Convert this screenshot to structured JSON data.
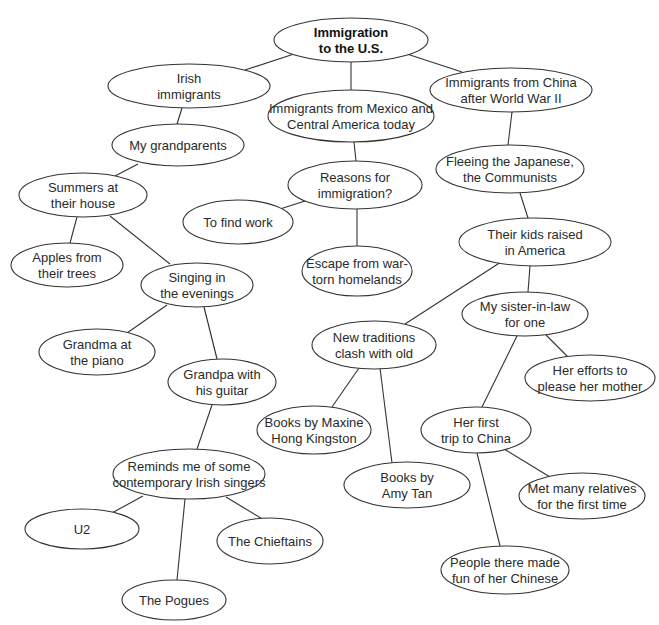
{
  "diagram": {
    "type": "cluster-map",
    "root": "n0",
    "nodes": [
      {
        "id": "n0",
        "lines": [
          "Immigration",
          "to the U.S."
        ],
        "cx": 351,
        "cy": 40,
        "rx": 77,
        "ry": 22,
        "bold": true
      },
      {
        "id": "n1",
        "lines": [
          "Irish",
          "immigrants"
        ],
        "cx": 189,
        "cy": 86,
        "rx": 81,
        "ry": 22
      },
      {
        "id": "n2",
        "lines": [
          "Immigrants from Mexico and",
          "Central America today"
        ],
        "cx": 351,
        "cy": 116,
        "rx": 83,
        "ry": 26
      },
      {
        "id": "n3",
        "lines": [
          "Immigrants from China",
          "after World War II"
        ],
        "cx": 511,
        "cy": 90,
        "rx": 81,
        "ry": 22
      },
      {
        "id": "n4",
        "lines": [
          "My grandparents"
        ],
        "cx": 178,
        "cy": 145,
        "rx": 66,
        "ry": 21
      },
      {
        "id": "n5",
        "lines": [
          "Reasons for",
          "immigration?"
        ],
        "cx": 355,
        "cy": 185,
        "rx": 67,
        "ry": 24
      },
      {
        "id": "n6",
        "lines": [
          "Fleeing the Japanese,",
          "the Communists"
        ],
        "cx": 510,
        "cy": 169,
        "rx": 74,
        "ry": 24
      },
      {
        "id": "n7",
        "lines": [
          "Summers at",
          "their house"
        ],
        "cx": 83,
        "cy": 195,
        "rx": 64,
        "ry": 22
      },
      {
        "id": "n8",
        "lines": [
          "To find work"
        ],
        "cx": 238,
        "cy": 222,
        "rx": 55,
        "ry": 22
      },
      {
        "id": "n9",
        "lines": [
          "Escape from war-",
          "torn homelands"
        ],
        "cx": 357,
        "cy": 271,
        "rx": 55,
        "ry": 25
      },
      {
        "id": "n10",
        "lines": [
          "Their kids raised",
          "in America"
        ],
        "cx": 535,
        "cy": 242,
        "rx": 76,
        "ry": 24
      },
      {
        "id": "n11",
        "lines": [
          "Apples from",
          "their trees"
        ],
        "cx": 67,
        "cy": 265,
        "rx": 56,
        "ry": 22
      },
      {
        "id": "n12",
        "lines": [
          "Singing in",
          "the evenings"
        ],
        "cx": 197,
        "cy": 285,
        "rx": 56,
        "ry": 22
      },
      {
        "id": "n13",
        "lines": [
          "My sister-in-law",
          "for one"
        ],
        "cx": 525,
        "cy": 314,
        "rx": 63,
        "ry": 22
      },
      {
        "id": "n14",
        "lines": [
          "New traditions",
          "clash with old"
        ],
        "cx": 374,
        "cy": 345,
        "rx": 62,
        "ry": 24
      },
      {
        "id": "n15",
        "lines": [
          "Her efforts to",
          "please her mother"
        ],
        "cx": 590,
        "cy": 378,
        "rx": 65,
        "ry": 23
      },
      {
        "id": "n16",
        "lines": [
          "Grandma at",
          "the piano"
        ],
        "cx": 97,
        "cy": 352,
        "rx": 58,
        "ry": 23
      },
      {
        "id": "n17",
        "lines": [
          "Grandpa with",
          "his guitar"
        ],
        "cx": 222,
        "cy": 382,
        "rx": 54,
        "ry": 23
      },
      {
        "id": "n18",
        "lines": [
          "Books by Maxine",
          "Hong Kingston"
        ],
        "cx": 314,
        "cy": 430,
        "rx": 57,
        "ry": 24
      },
      {
        "id": "n19",
        "lines": [
          "Her first",
          "trip to China"
        ],
        "cx": 476,
        "cy": 430,
        "rx": 55,
        "ry": 23
      },
      {
        "id": "n20",
        "lines": [
          "Books by",
          "Amy Tan"
        ],
        "cx": 407,
        "cy": 485,
        "rx": 63,
        "ry": 23
      },
      {
        "id": "n21",
        "lines": [
          "Reminds me of some",
          "contemporary Irish singers"
        ],
        "cx": 189,
        "cy": 474,
        "rx": 76,
        "ry": 25
      },
      {
        "id": "n22",
        "lines": [
          "Met many relatives",
          "for the first time"
        ],
        "cx": 582,
        "cy": 496,
        "rx": 63,
        "ry": 23
      },
      {
        "id": "n23",
        "lines": [
          "U2"
        ],
        "cx": 82,
        "cy": 529,
        "rx": 57,
        "ry": 20
      },
      {
        "id": "n24",
        "lines": [
          "The Chieftains"
        ],
        "cx": 270,
        "cy": 541,
        "rx": 53,
        "ry": 23
      },
      {
        "id": "n25",
        "lines": [
          "People there made",
          "fun of her Chinese"
        ],
        "cx": 505,
        "cy": 570,
        "rx": 64,
        "ry": 24
      },
      {
        "id": "n26",
        "lines": [
          "The Pogues"
        ],
        "cx": 174,
        "cy": 600,
        "rx": 52,
        "ry": 20
      }
    ],
    "edges": [
      {
        "from": "n0",
        "to": "n1",
        "x1": 297,
        "y1": 53,
        "x2": 245,
        "y2": 70
      },
      {
        "from": "n0",
        "to": "n2",
        "x1": 351,
        "y1": 62,
        "x2": 351,
        "y2": 90
      },
      {
        "from": "n0",
        "to": "n3",
        "x1": 407,
        "y1": 54,
        "x2": 462,
        "y2": 72
      },
      {
        "from": "n1",
        "to": "n4",
        "x1": 182,
        "y1": 108,
        "x2": 177,
        "y2": 124
      },
      {
        "from": "n2",
        "to": "n5",
        "x1": 354,
        "y1": 142,
        "x2": 356,
        "y2": 161
      },
      {
        "from": "n3",
        "to": "n6",
        "x1": 512,
        "y1": 112,
        "x2": 508,
        "y2": 145
      },
      {
        "from": "n4",
        "to": "n7",
        "x1": 138,
        "y1": 164,
        "x2": 115,
        "y2": 176
      },
      {
        "from": "n5",
        "to": "n8",
        "x1": 305,
        "y1": 201,
        "x2": 280,
        "y2": 209
      },
      {
        "from": "n5",
        "to": "n9",
        "x1": 357,
        "y1": 209,
        "x2": 357,
        "y2": 246
      },
      {
        "from": "n6",
        "to": "n10",
        "x1": 520,
        "y1": 193,
        "x2": 528,
        "y2": 218
      },
      {
        "from": "n7",
        "to": "n11",
        "x1": 77,
        "y1": 217,
        "x2": 70,
        "y2": 243
      },
      {
        "from": "n7",
        "to": "n12",
        "x1": 110,
        "y1": 216,
        "x2": 170,
        "y2": 264
      },
      {
        "from": "n10",
        "to": "n13",
        "x1": 530,
        "y1": 266,
        "x2": 528,
        "y2": 292
      },
      {
        "from": "n10",
        "to": "n14",
        "x1": 501,
        "y1": 262,
        "x2": 405,
        "y2": 324
      },
      {
        "from": "n13",
        "to": "n15",
        "x1": 546,
        "y1": 335,
        "x2": 570,
        "y2": 359
      },
      {
        "from": "n13",
        "to": "n19",
        "x1": 517,
        "y1": 336,
        "x2": 482,
        "y2": 407
      },
      {
        "from": "n12",
        "to": "n16",
        "x1": 167,
        "y1": 305,
        "x2": 127,
        "y2": 333
      },
      {
        "from": "n12",
        "to": "n17",
        "x1": 204,
        "y1": 307,
        "x2": 217,
        "y2": 359
      },
      {
        "from": "n14",
        "to": "n18",
        "x1": 359,
        "y1": 368,
        "x2": 332,
        "y2": 407
      },
      {
        "from": "n14",
        "to": "n20",
        "x1": 380,
        "y1": 368,
        "x2": 392,
        "y2": 463
      },
      {
        "from": "n17",
        "to": "n21",
        "x1": 212,
        "y1": 405,
        "x2": 197,
        "y2": 449
      },
      {
        "from": "n19",
        "to": "n22",
        "x1": 504,
        "y1": 449,
        "x2": 550,
        "y2": 477
      },
      {
        "from": "n19",
        "to": "n25",
        "x1": 477,
        "y1": 453,
        "x2": 500,
        "y2": 546
      },
      {
        "from": "n21",
        "to": "n23",
        "x1": 143,
        "y1": 496,
        "x2": 110,
        "y2": 514
      },
      {
        "from": "n21",
        "to": "n24",
        "x1": 226,
        "y1": 497,
        "x2": 264,
        "y2": 520
      },
      {
        "from": "n21",
        "to": "n26",
        "x1": 185,
        "y1": 499,
        "x2": 177,
        "y2": 580
      }
    ]
  }
}
